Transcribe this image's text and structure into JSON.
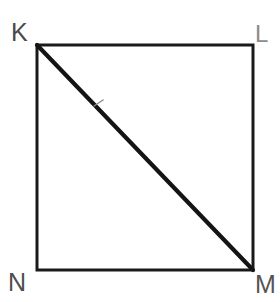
{
  "figure": {
    "kind": "geometry-diagram",
    "shape": "square-with-diagonal",
    "background_color": "#ffffff",
    "stroke_color": "#1a1a1a",
    "square": {
      "name": "square-KLMN",
      "left": 36,
      "top": 44,
      "right": 254,
      "bottom": 271,
      "side_stroke_width": 3
    },
    "diagonal": {
      "name": "diagonal-KM",
      "from": "K",
      "to": "M",
      "x1": 37,
      "y1": 45,
      "x2": 253,
      "y2": 270,
      "stroke_width": 4,
      "tick_mark": {
        "name": "congruence-tick",
        "x": 98,
        "y": 103,
        "color": "#7d7d7d",
        "length": 9,
        "stroke_width": 1
      }
    },
    "vertices": [
      {
        "id": "K",
        "label": "K",
        "position": "top-left",
        "x": 37,
        "y": 45,
        "color": "#4a4a4a"
      },
      {
        "id": "L",
        "label": "L",
        "position": "top-right",
        "x": 253,
        "y": 45,
        "color": "#8c8c8c"
      },
      {
        "id": "M",
        "label": "M",
        "position": "bottom-right",
        "x": 253,
        "y": 270,
        "color": "#545454"
      },
      {
        "id": "N",
        "label": "N",
        "position": "bottom-left",
        "x": 37,
        "y": 270,
        "color": "#4e4e4e"
      }
    ]
  }
}
